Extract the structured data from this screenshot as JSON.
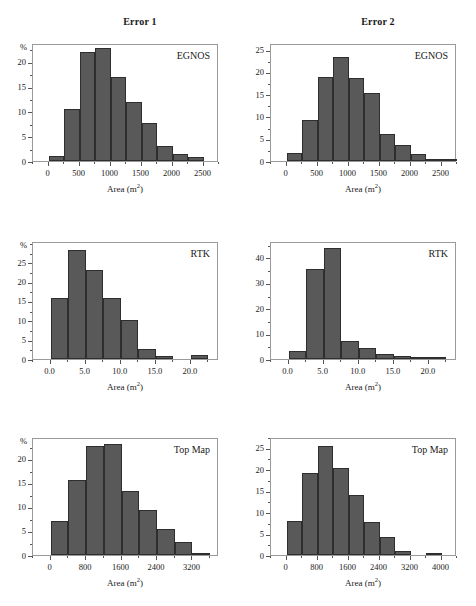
{
  "figure": {
    "column_headers": [
      "Error 1",
      "Error 2"
    ],
    "axis_title": "Area (m",
    "axis_title_sup": "2",
    "axis_title_tail": ")",
    "percent_symbol": "%"
  },
  "chart_data": [
    {
      "type": "bar",
      "title": "Error 1",
      "panel_label": "EGNOS",
      "xlabel": "Area (m2)",
      "ylabel": "%",
      "xlim": [
        -250,
        2750
      ],
      "ylim": [
        0,
        23.8
      ],
      "xticks": [
        0,
        500,
        1000,
        1500,
        2000,
        2500
      ],
      "xtick_labels": [
        "0",
        "500",
        "1000",
        "1500",
        "2000",
        "2500"
      ],
      "yticks": [
        0,
        5,
        10,
        15,
        20
      ],
      "ytick_labels": [
        "0",
        "5",
        "10",
        "15",
        "20"
      ],
      "bin_width": 250,
      "bin_starts": [
        0,
        250,
        500,
        750,
        1000,
        1250,
        1500,
        1750,
        2000,
        2250
      ],
      "values": [
        1.0,
        10.4,
        22.0,
        22.8,
        17.0,
        11.9,
        7.7,
        3.0,
        1.5,
        0.9
      ],
      "grid": false,
      "legend": "none"
    },
    {
      "type": "bar",
      "title": "Error 2",
      "panel_label": "EGNOS",
      "xlabel": "Area (m2)",
      "ylabel": "",
      "xlim": [
        -250,
        2750
      ],
      "ylim": [
        0,
        26.5
      ],
      "xticks": [
        0,
        500,
        1000,
        1500,
        2000,
        2500
      ],
      "xtick_labels": [
        "0",
        "500",
        "1000",
        "1500",
        "2000",
        "2500"
      ],
      "yticks": [
        0,
        5,
        10,
        15,
        20,
        25
      ],
      "ytick_labels": [
        "0",
        "5",
        "10",
        "15",
        "20",
        "25"
      ],
      "bin_width": 250,
      "bin_starts": [
        0,
        250,
        500,
        750,
        1000,
        1250,
        1500,
        1750,
        2000,
        2250,
        2500
      ],
      "values": [
        1.9,
        9.3,
        18.8,
        23.3,
        18.7,
        15.2,
        6.1,
        3.5,
        1.5,
        0.3,
        0.2
      ],
      "grid": false,
      "legend": "none"
    },
    {
      "type": "bar",
      "title": "Error 1",
      "panel_label": "RTK",
      "xlabel": "Area (m2)",
      "ylabel": "%",
      "xlim": [
        -2.5,
        24.0
      ],
      "ylim": [
        0,
        30.5
      ],
      "xticks": [
        0.0,
        5.0,
        10.0,
        15.0,
        20.0
      ],
      "xtick_labels": [
        "0.0",
        "5.0",
        "10.0",
        "15.0",
        "20.0"
      ],
      "yticks": [
        0,
        5,
        10,
        15,
        20,
        25
      ],
      "ytick_labels": [
        "0",
        "5",
        "10",
        "15",
        "20",
        "25"
      ],
      "bin_width": 2.5,
      "bin_starts": [
        0.0,
        2.5,
        5.0,
        7.5,
        10.0,
        12.5,
        15.0,
        20.0
      ],
      "values": [
        15.8,
        28.2,
        22.9,
        15.8,
        10.1,
        2.6,
        0.9,
        1.1
      ],
      "grid": false,
      "legend": "none"
    },
    {
      "type": "bar",
      "title": "Error 2",
      "panel_label": "RTK",
      "xlabel": "Area (m2)",
      "ylabel": "",
      "xlim": [
        -2.5,
        24.0
      ],
      "ylim": [
        0,
        46.5
      ],
      "xticks": [
        0.0,
        5.0,
        10.0,
        15.0,
        20.0
      ],
      "xtick_labels": [
        "0.0",
        "5.0",
        "10.0",
        "15.0",
        "20.0"
      ],
      "yticks": [
        0,
        10,
        20,
        30,
        40
      ],
      "ytick_labels": [
        "0",
        "10",
        "20",
        "30",
        "40"
      ],
      "bin_width": 2.5,
      "bin_starts": [
        0.0,
        2.5,
        5.0,
        7.5,
        10.0,
        12.5,
        15.0,
        17.5,
        20.0
      ],
      "values": [
        3.0,
        35.3,
        43.8,
        7.1,
        4.3,
        2.0,
        1.1,
        0.4,
        0.4
      ],
      "grid": false,
      "legend": "none"
    },
    {
      "type": "bar",
      "title": "Error 1",
      "panel_label": "Top Map",
      "xlabel": "Area (m2)",
      "ylabel": "%",
      "xlim": [
        -400,
        3800
      ],
      "ylim": [
        0,
        24.5
      ],
      "xticks": [
        0,
        800,
        1600,
        2400,
        3200
      ],
      "xtick_labels": [
        "0",
        "800",
        "1600",
        "2400",
        "3200"
      ],
      "yticks": [
        0,
        5,
        10,
        15,
        20
      ],
      "ytick_labels": [
        "0",
        "5",
        "10",
        "15",
        "20"
      ],
      "bin_width": 400,
      "bin_starts": [
        0,
        400,
        800,
        1200,
        1600,
        2000,
        2400,
        2800,
        3200
      ],
      "values": [
        7.0,
        15.5,
        22.6,
        23.0,
        13.2,
        9.3,
        5.4,
        2.7,
        0.3
      ],
      "grid": false,
      "legend": "none"
    },
    {
      "type": "bar",
      "title": "Error 2",
      "panel_label": "Top Map",
      "xlabel": "Area (m2)",
      "ylabel": "",
      "xlim": [
        -400,
        4400
      ],
      "ylim": [
        0,
        27.5
      ],
      "xticks": [
        0,
        800,
        1600,
        2400,
        3200,
        4000
      ],
      "xtick_labels": [
        "0",
        "800",
        "1600",
        "2400",
        "3200",
        "4000"
      ],
      "yticks": [
        0,
        5,
        10,
        15,
        20,
        25
      ],
      "ytick_labels": [
        "0",
        "5",
        "10",
        "15",
        "20",
        "25"
      ],
      "bin_width": 400,
      "bin_starts": [
        0,
        400,
        800,
        1200,
        1600,
        2000,
        2400,
        2800,
        3600
      ],
      "values": [
        7.9,
        19.1,
        25.4,
        20.3,
        14.1,
        7.6,
        4.3,
        0.9,
        0.4
      ],
      "grid": false,
      "legend": "none"
    }
  ],
  "colors": {
    "bar_fill": "#595959",
    "bar_edge": "#2e2e2e",
    "axis": "#555555",
    "frame": "#9a9a9a",
    "background": "#ffffff"
  }
}
